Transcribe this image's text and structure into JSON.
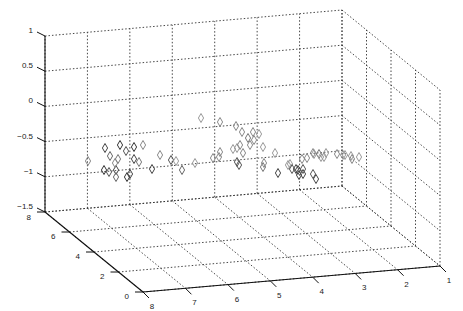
{
  "chart_data": {
    "type": "scatter",
    "dimensions": 3,
    "title": "",
    "xlabel": "",
    "ylabel": "",
    "zlabel": "",
    "marker": "diamond",
    "marker_color": "#333333",
    "grid": true,
    "grid_style": "dotted",
    "xlim": [
      1,
      8
    ],
    "ylim": [
      0,
      8
    ],
    "zlim": [
      -1.5,
      1
    ],
    "x_ticks": [
      "8",
      "7",
      "6",
      "5",
      "4",
      "3",
      "2",
      "1"
    ],
    "y_ticks": [
      "0",
      "2",
      "4",
      "6",
      "8"
    ],
    "z_ticks": [
      "1",
      "0.5",
      "0",
      "-0.5",
      "-1",
      "-1.5"
    ],
    "points_screen": [
      [
        88,
        161,
        "#888"
      ],
      [
        105,
        148,
        "#444"
      ],
      [
        110,
        156,
        "#666"
      ],
      [
        120,
        145,
        "#333"
      ],
      [
        118,
        159,
        "#777"
      ],
      [
        126,
        151,
        "#555"
      ],
      [
        143,
        145,
        "#888"
      ],
      [
        134,
        147,
        "#333"
      ],
      [
        134,
        159,
        "#444"
      ],
      [
        104,
        170,
        "#333"
      ],
      [
        109,
        172,
        "#555"
      ],
      [
        116,
        170,
        "#444"
      ],
      [
        116,
        177,
        "#666"
      ],
      [
        115,
        163,
        "#888"
      ],
      [
        127,
        177,
        "#333"
      ],
      [
        130,
        174,
        "#444"
      ],
      [
        139,
        162,
        "#777"
      ],
      [
        152,
        169,
        "#444"
      ],
      [
        160,
        155,
        "#888"
      ],
      [
        171,
        160,
        "#555"
      ],
      [
        182,
        170,
        "#666"
      ],
      [
        176,
        161,
        "#999"
      ],
      [
        195,
        163,
        "#999"
      ],
      [
        201,
        118,
        "#999"
      ],
      [
        220,
        122,
        "#888"
      ],
      [
        236,
        126,
        "#888"
      ],
      [
        242,
        132,
        "#888"
      ],
      [
        248,
        138,
        "#777"
      ],
      [
        253,
        132,
        "#888"
      ],
      [
        254,
        140,
        "#888"
      ],
      [
        250,
        145,
        "#888"
      ],
      [
        259,
        134,
        "#999"
      ],
      [
        213,
        158,
        "#888"
      ],
      [
        220,
        152,
        "#888"
      ],
      [
        219,
        157,
        "#888"
      ],
      [
        237,
        148,
        "#999"
      ],
      [
        240,
        145,
        "#888"
      ],
      [
        243,
        153,
        "#888"
      ],
      [
        233,
        149,
        "#999"
      ],
      [
        237,
        162,
        "#555"
      ],
      [
        239,
        165,
        "#555"
      ],
      [
        263,
        147,
        "#999"
      ],
      [
        263,
        167,
        "#777"
      ],
      [
        278,
        173,
        "#444"
      ],
      [
        290,
        164,
        "#999"
      ],
      [
        275,
        153,
        "#999"
      ],
      [
        264,
        163,
        "#888"
      ],
      [
        298,
        170,
        "#444"
      ],
      [
        299,
        175,
        "#444"
      ],
      [
        302,
        159,
        "#888"
      ],
      [
        313,
        153,
        "#888"
      ],
      [
        314,
        154,
        "#999"
      ],
      [
        324,
        157,
        "#999"
      ],
      [
        326,
        153,
        "#999"
      ],
      [
        307,
        158,
        "#888"
      ],
      [
        319,
        154,
        "#777"
      ],
      [
        296,
        169,
        "#444"
      ],
      [
        303,
        169,
        "#555"
      ],
      [
        303,
        174,
        "#444"
      ],
      [
        313,
        174,
        "#555"
      ],
      [
        292,
        169,
        "#555"
      ],
      [
        288,
        165,
        "#999"
      ],
      [
        316,
        179,
        "#444"
      ],
      [
        321,
        157,
        "#999"
      ],
      [
        337,
        154,
        "#888"
      ],
      [
        343,
        155,
        "#999"
      ],
      [
        345,
        155,
        "#999"
      ],
      [
        351,
        156,
        "#999"
      ],
      [
        359,
        157,
        "#999"
      ],
      [
        352,
        159,
        "#888"
      ]
    ],
    "note": "3D scatter of ~70 diamond markers clustered between z = -1 and z = -0.4, spread across x 1..8 and y 0..8; values approximate"
  },
  "axes": {
    "z_tick_labels": [
      "1",
      "0.5",
      "0",
      "−0.5",
      "−1",
      "−1.5"
    ],
    "y_tick_labels": [
      "8",
      "6",
      "4",
      "2",
      "0"
    ],
    "x_tick_labels": [
      "8",
      "7",
      "6",
      "5",
      "4",
      "3",
      "2",
      "1"
    ]
  }
}
